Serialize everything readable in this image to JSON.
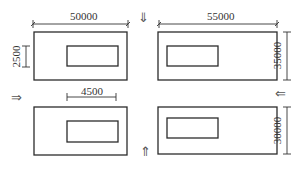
{
  "diagram": {
    "panels": [
      {
        "id": "top-left",
        "outer": {
          "x": 34,
          "y": 32,
          "w": 93,
          "h": 48
        },
        "inner": {
          "x": 67,
          "y": 46,
          "w": 51,
          "h": 20
        }
      },
      {
        "id": "top-right",
        "outer": {
          "x": 158,
          "y": 32,
          "w": 119,
          "h": 48
        },
        "inner": {
          "x": 167,
          "y": 46,
          "w": 51,
          "h": 20
        }
      },
      {
        "id": "bottom-left",
        "outer": {
          "x": 34,
          "y": 107,
          "w": 93,
          "h": 48
        },
        "inner": {
          "x": 67,
          "y": 121,
          "w": 51,
          "h": 21
        }
      },
      {
        "id": "bottom-right",
        "outer": {
          "x": 158,
          "y": 107,
          "w": 119,
          "h": 47
        },
        "inner": {
          "x": 167,
          "y": 118,
          "w": 51,
          "h": 20
        }
      }
    ],
    "dimensions": {
      "top_left_width": "50000",
      "top_right_width": "55000",
      "top_left_inner_height": "2500",
      "top_right_height": "35000",
      "bottom_left_inner_width": "4500",
      "bottom_right_height": "30000"
    },
    "arrows": {
      "down": "⇓",
      "right": "⇒",
      "up": "⇑",
      "left": "⇐"
    },
    "colors": {
      "line": "#2b2b2b",
      "text": "#333333",
      "arrow": "#555555"
    }
  }
}
